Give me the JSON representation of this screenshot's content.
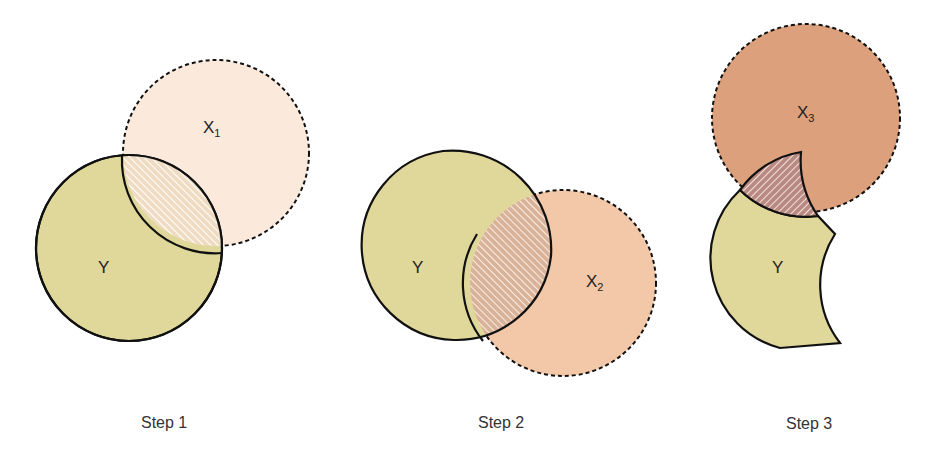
{
  "colors": {
    "y_fill": "#e0d89a",
    "x1_fill": "#fbeadc",
    "x2_fill": "#f2c8a8",
    "x3_fill": "#dca07c",
    "hatch1_bg": "#f0dcc4",
    "hatch2_bg": "#eac2aa",
    "hatch3_bg": "#d9a59a",
    "stroke": "#111111"
  },
  "steps": [
    {
      "label": "Step 1",
      "y_label": "Y",
      "x_label": "X",
      "x_sub": "1"
    },
    {
      "label": "Step 2",
      "y_label": "Y",
      "x_label": "X",
      "x_sub": "2"
    },
    {
      "label": "Step 3",
      "y_label": "Y",
      "x_label": "X",
      "x_sub": "3"
    }
  ]
}
